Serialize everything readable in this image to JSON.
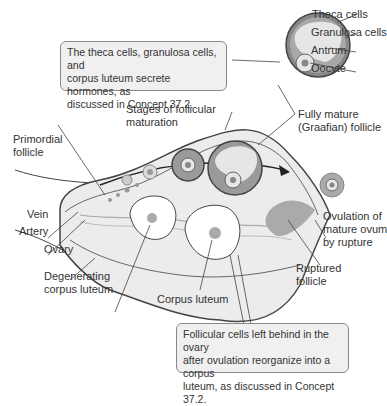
{
  "callouts": {
    "top": [
      "The theca cells, granulosa cells, and",
      "corpus luteum secrete hormones, as",
      "discussed in Concept 37.2."
    ],
    "bottom": [
      "Follicular cells left behind in the ovary",
      "after ovulation reorganize into a corpus",
      "luteum, as discussed in Concept 37.2."
    ]
  },
  "labels": {
    "theca": "Theca cells",
    "granulosa": "Granulosa cells",
    "antrum": "Antrum",
    "oocyte": "Oocyte",
    "stages": [
      "Stages of follicular",
      "maturation"
    ],
    "graafian": [
      "Fully mature",
      "(Graafian) follicle"
    ],
    "primordial": [
      "Primordial",
      "follicle"
    ],
    "vein": "Vein",
    "artery": "Artery",
    "ovary": "Ovary",
    "degenerating": [
      "Degenerating",
      "corpus luteum"
    ],
    "corpus_luteum": "Corpus luteum",
    "ovulation": [
      "Ovulation of",
      "mature ovum",
      "by rupture"
    ],
    "ruptured": [
      "Ruptured",
      "follicle"
    ]
  },
  "colors": {
    "ovary_fill": "#ececec",
    "follicle_dark": "#9a9a9a",
    "follicle_light": "#e6e6e6",
    "line": "#444444",
    "callout_bg": "#f0f0f0"
  }
}
